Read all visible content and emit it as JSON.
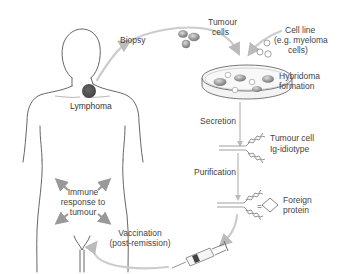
{
  "diagram": {
    "labels": {
      "lymphoma": "Lymphoma",
      "biopsy": "Biopsy",
      "tumour_cells_1": "Tumour",
      "tumour_cells_2": "cells",
      "cell_line_1": "Cell line",
      "cell_line_2": "(e.g. myeloma",
      "cell_line_3": "cells)",
      "hybridoma_1": "Hybridoma",
      "hybridoma_2": "formation",
      "secretion": "Secretion",
      "ig_idiotype_1": "Tumour cell",
      "ig_idiotype_2": "Ig-idiotype",
      "purification": "Purification",
      "foreign_protein_1": "Foreign",
      "foreign_protein_2": "protein",
      "equals": "=",
      "vaccination_1": "Vaccination",
      "vaccination_2": "(post-remission)",
      "immune_1": "Immune",
      "immune_2": "response to",
      "immune_3": "tumour"
    },
    "colors": {
      "tumour_mass": "#555555",
      "tumour_cell": "#888888",
      "flow_arrow": "#cccccc",
      "outline": "#555555",
      "text": "#444444"
    },
    "steps": [
      "Biopsy",
      "Hybridoma formation",
      "Secretion",
      "Purification",
      "Vaccination (post-remission)",
      "Immune response to tumour"
    ]
  }
}
